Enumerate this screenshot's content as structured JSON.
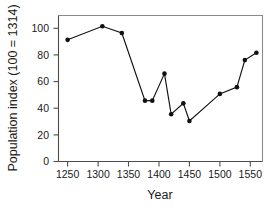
{
  "chart_data": {
    "type": "line",
    "title": "",
    "xlabel": "Year",
    "ylabel": "Population index (100 = 1314)",
    "xlim": [
      1235,
      1570
    ],
    "ylim": [
      0,
      108
    ],
    "xticks": [
      1250,
      1300,
      1350,
      1400,
      1450,
      1500,
      1550
    ],
    "xtick_labels": [
      "1250",
      "1300",
      "1350",
      "1400",
      "1450",
      "1500",
      "1550"
    ],
    "yticks": [
      0,
      20,
      40,
      60,
      80,
      100
    ],
    "ytick_labels": [
      "0",
      "20",
      "40",
      "60",
      "80",
      "100"
    ],
    "grid": false,
    "legend": "none",
    "marker": "filled-circle",
    "x": [
      1250,
      1307,
      1339,
      1377,
      1389,
      1409,
      1420,
      1440,
      1450,
      1500,
      1528,
      1541,
      1560
    ],
    "values": [
      90,
      100,
      95,
      45,
      45,
      65,
      35,
      43,
      30,
      50,
      55,
      75,
      80.5
    ],
    "series": [
      {
        "name": "Population index",
        "points": [
          {
            "x": 1250,
            "y": 90
          },
          {
            "x": 1307,
            "y": 100
          },
          {
            "x": 1339,
            "y": 95
          },
          {
            "x": 1377,
            "y": 45
          },
          {
            "x": 1389,
            "y": 45
          },
          {
            "x": 1409,
            "y": 65
          },
          {
            "x": 1420,
            "y": 35
          },
          {
            "x": 1440,
            "y": 43
          },
          {
            "x": 1450,
            "y": 30
          },
          {
            "x": 1500,
            "y": 50
          },
          {
            "x": 1528,
            "y": 55
          },
          {
            "x": 1541,
            "y": 75
          },
          {
            "x": 1560,
            "y": 80.5
          }
        ]
      }
    ],
    "colors": {
      "line": "#111111",
      "marker": "#111111",
      "axis": "#4d4d4d",
      "frame": "#8a8a8a",
      "text": "#1a1a1a",
      "background": "#ffffff"
    }
  },
  "labels": {
    "x_axis_title": "Year",
    "y_axis_title": "Population index (100 = 1314)"
  }
}
